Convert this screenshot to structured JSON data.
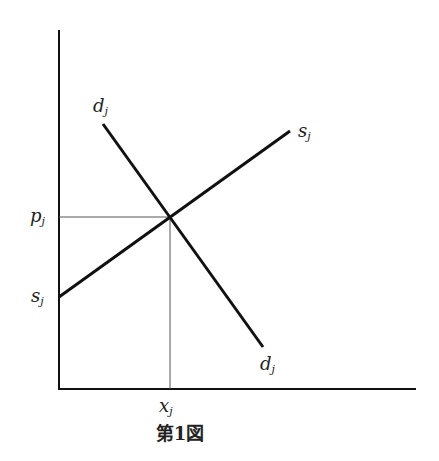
{
  "diagram": {
    "type": "supply-demand",
    "caption": "第1図",
    "labels": {
      "demand_top": "d",
      "demand_top_sub": "j",
      "demand_bottom": "d",
      "demand_bottom_sub": "j",
      "supply_top": "s",
      "supply_top_sub": "j",
      "supply_left": "s",
      "supply_left_sub": "j",
      "price": "p",
      "price_sub": "j",
      "quantity": "x",
      "quantity_sub": "j"
    },
    "lines": {
      "y_axis": {
        "x1": 59,
        "y1": 30,
        "x2": 59,
        "y2": 389
      },
      "x_axis": {
        "x1": 58,
        "y1": 389,
        "x2": 416,
        "y2": 389
      },
      "demand": {
        "x1": 103,
        "y1": 124,
        "x2": 263,
        "y2": 347
      },
      "supply": {
        "x1": 59,
        "y1": 297,
        "x2": 290,
        "y2": 131
      },
      "price_guide": {
        "x1": 59,
        "y1": 217,
        "x2": 170,
        "y2": 217
      },
      "quantity_guide": {
        "x1": 170,
        "y1": 217,
        "x2": 170,
        "y2": 389
      }
    },
    "equilibrium": {
      "x": 170,
      "y": 217
    }
  }
}
